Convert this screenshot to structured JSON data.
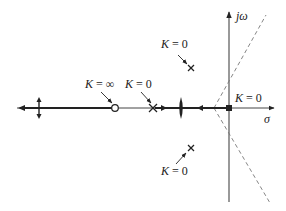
{
  "diagram": {
    "type": "root-locus",
    "axes": {
      "real_axis_label": "σ",
      "imag_axis_label": "jω"
    },
    "poles": [
      {
        "id": "pole-real",
        "label": "K = 0"
      },
      {
        "id": "pole-upper",
        "label": "K = 0"
      },
      {
        "id": "pole-lower",
        "label": "K = 0"
      },
      {
        "id": "pole-origin",
        "label": "K = 0"
      }
    ],
    "zeros": [
      {
        "id": "zero-real",
        "label": "K = ∞"
      }
    ],
    "asymptotes": {
      "style": "dashed",
      "count": 2
    },
    "colors": {
      "ink": "#222222",
      "axis": "#555555",
      "dashed": "#777777"
    }
  }
}
